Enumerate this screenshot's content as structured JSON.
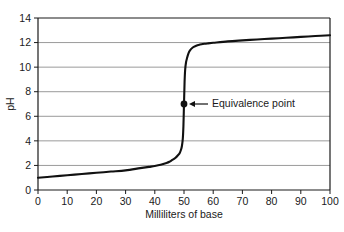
{
  "chart_data": {
    "type": "line",
    "title": "",
    "xlabel": "Milliliters of base",
    "ylabel": "pH",
    "xlim": [
      0,
      100
    ],
    "ylim": [
      0,
      14
    ],
    "xticks": [
      0,
      10,
      20,
      30,
      40,
      50,
      60,
      70,
      80,
      90,
      100
    ],
    "yticks": [
      0,
      2,
      4,
      6,
      8,
      10,
      12,
      14
    ],
    "xtick_labels": [
      "0",
      "10",
      "20",
      "30",
      "40",
      "50",
      "60",
      "70",
      "80",
      "90",
      "100"
    ],
    "ytick_labels": [
      "0",
      "2",
      "4",
      "6",
      "8",
      "10",
      "12",
      "14"
    ],
    "grid": "horizontal",
    "legend": "none",
    "series": [
      {
        "name": "Titration curve",
        "x": [
          0,
          5,
          10,
          15,
          20,
          25,
          30,
          35,
          38,
          40,
          42,
          44,
          45,
          46,
          47,
          48,
          48.5,
          49,
          49.3,
          49.6,
          49.8,
          50,
          50.2,
          50.4,
          50.7,
          51,
          51.5,
          52,
          53,
          54,
          55,
          56,
          57,
          58,
          60,
          65,
          70,
          75,
          80,
          85,
          90,
          95,
          100
        ],
        "y": [
          1.0,
          1.1,
          1.2,
          1.3,
          1.4,
          1.5,
          1.6,
          1.78,
          1.88,
          1.95,
          2.05,
          2.2,
          2.3,
          2.45,
          2.6,
          2.85,
          3.0,
          3.3,
          3.6,
          4.2,
          5.2,
          7.0,
          8.8,
          9.8,
          10.4,
          10.7,
          11.1,
          11.35,
          11.6,
          11.72,
          11.8,
          11.86,
          11.9,
          11.93,
          11.98,
          12.1,
          12.18,
          12.25,
          12.32,
          12.39,
          12.46,
          12.53,
          12.6
        ]
      }
    ],
    "annotations": [
      {
        "label": "Equivalence point",
        "point_x": 50,
        "point_y": 7.0,
        "marker": "filled-circle",
        "leader": "arrow-left"
      }
    ],
    "colors": {
      "curve": "#111111",
      "gridline": "#9a9a9a",
      "axis": "#1a1a1a",
      "background": "#ffffff",
      "text": "#1a1a1a",
      "marker": "#111111"
    }
  }
}
